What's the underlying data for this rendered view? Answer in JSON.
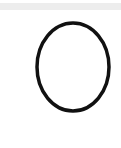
{
  "canvas": {
    "background": "#ffffff",
    "top_strip_color": "#ededed"
  },
  "shape": {
    "type": "ellipse",
    "stroke_color": "#111111",
    "fill": "none",
    "stroke_width": 3.5,
    "cx": 73,
    "cy": 67,
    "rx": 36,
    "ry": 44
  }
}
